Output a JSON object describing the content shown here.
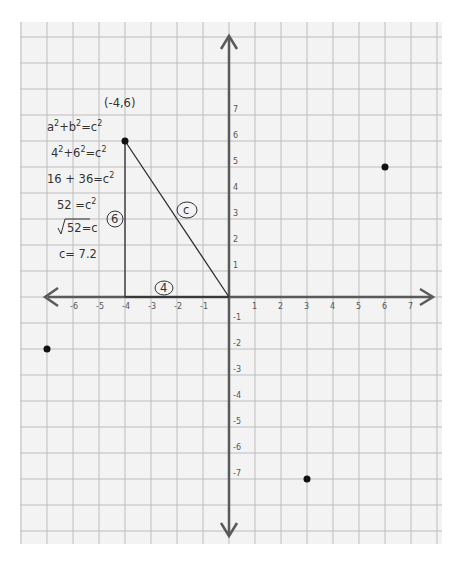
{
  "chart_data": {
    "type": "scatter",
    "title": "",
    "xlabel": "",
    "ylabel": "",
    "xlim": [
      -8,
      8
    ],
    "ylim": [
      -9,
      10
    ],
    "grid": true,
    "x_ticks": [
      -6,
      -5,
      -4,
      -3,
      -2,
      -1,
      1,
      2,
      3,
      4,
      5,
      6,
      7
    ],
    "y_ticks": [
      7,
      6,
      5,
      4,
      3,
      2,
      1,
      -1,
      -2,
      -3,
      -4,
      -5,
      -6,
      -7
    ],
    "points": [
      {
        "x": -4,
        "y": 6,
        "label": "(-4,6)"
      },
      {
        "x": 6,
        "y": 5,
        "label": ""
      },
      {
        "x": -7,
        "y": -2,
        "label": ""
      },
      {
        "x": 3,
        "y": -7,
        "label": ""
      }
    ],
    "segments": [
      {
        "from": [
          -4,
          6
        ],
        "to": [
          -4,
          0
        ],
        "label": "6"
      },
      {
        "from": [
          -4,
          0
        ],
        "to": [
          0,
          0
        ],
        "label": "4"
      },
      {
        "from": [
          -4,
          6
        ],
        "to": [
          0,
          0
        ],
        "label": "c"
      }
    ],
    "annotations": [
      "(-4,6)",
      "a²+b²=c²",
      "4²+6²=c²",
      "16 + 36=c²",
      "52 =c²",
      "√52=c",
      "c= 7.2"
    ]
  },
  "labels": {
    "point_label": "(-4,6)",
    "side_a": "4",
    "side_b": "6",
    "side_c": "c",
    "work": [
      {
        "base": "a",
        "sup1": "2",
        "mid": "+b",
        "sup2": "2",
        "rhs": "=c",
        "sup3": "2"
      },
      {
        "base": "4",
        "sup1": "2",
        "mid": "+6",
        "sup2": "2",
        "rhs": "=c",
        "sup3": "2"
      },
      {
        "base": "16 + 36",
        "sup1": "",
        "mid": "",
        "sup2": "",
        "rhs": "=c",
        "sup3": "2"
      },
      {
        "base": "52",
        "sup1": "",
        "mid": "",
        "sup2": "",
        "rhs": " =c",
        "sup3": "2"
      },
      {
        "base": "52",
        "sup1": "",
        "mid": "",
        "sup2": "",
        "rhs": "=c",
        "sup3": ""
      },
      {
        "base": "c= 7.2",
        "sup1": "",
        "mid": "",
        "sup2": "",
        "rhs": "",
        "sup3": ""
      }
    ]
  },
  "colors": {
    "paper": "#f3f3f3",
    "grid": "#bdbdbd",
    "axis": "#5a5a5a",
    "ink": "#2e2e2e"
  }
}
